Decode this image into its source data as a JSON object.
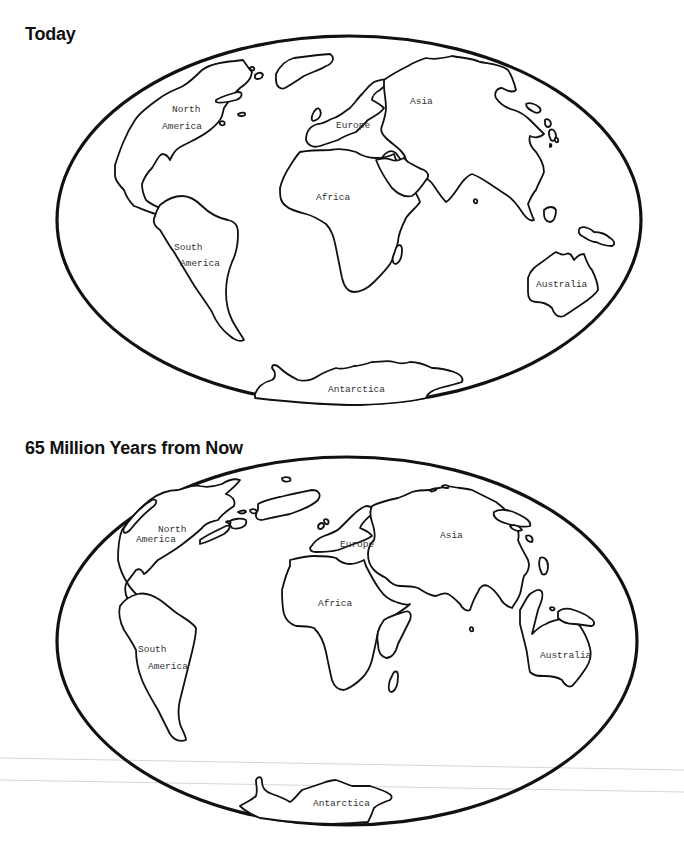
{
  "maps": [
    {
      "title": "Today",
      "labels": {
        "north_america_1": "North",
        "north_america_2": "America",
        "south_america_1": "South",
        "south_america_2": "America",
        "europe": "Europe",
        "asia": "Asia",
        "africa": "Africa",
        "australia": "Australia",
        "antarctica": "Antarctica"
      }
    },
    {
      "title": "65 Million Years from Now",
      "labels": {
        "north_america_1": "North",
        "north_america_2": "America",
        "south_america_1": "South",
        "south_america_2": "America",
        "europe": "Europe",
        "asia": "Asia",
        "africa": "Africa",
        "australia": "Australia",
        "antarctica": "Antarctica"
      }
    }
  ],
  "colors": {
    "outline": "#111111",
    "background": "#ffffff",
    "label": "#333333"
  }
}
